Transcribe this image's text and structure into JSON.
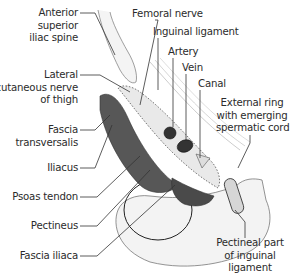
{
  "diagram": {
    "labels_left": [
      {
        "id": "asis",
        "lines": [
          "Anterior",
          "superior",
          "iliac spine"
        ]
      },
      {
        "id": "lcnt",
        "lines": [
          "Lateral",
          "cutaneous nerve",
          "of thigh"
        ]
      },
      {
        "id": "fascia_transversalis",
        "lines": [
          "Fascia",
          "transversalis"
        ]
      },
      {
        "id": "iliacus",
        "lines": [
          "Iliacus"
        ]
      },
      {
        "id": "psoas",
        "lines": [
          "Psoas tendon"
        ]
      },
      {
        "id": "pectineus",
        "lines": [
          "Pectineus"
        ]
      },
      {
        "id": "fascia_iliaca",
        "lines": [
          "Fascia iliaca"
        ]
      }
    ],
    "labels_top": [
      {
        "id": "femoral_nerve",
        "lines": [
          "Femoral nerve"
        ]
      },
      {
        "id": "inguinal_ligament",
        "lines": [
          "Inguinal ligament"
        ]
      },
      {
        "id": "artery",
        "lines": [
          "Artery"
        ]
      },
      {
        "id": "vein",
        "lines": [
          "Vein"
        ]
      },
      {
        "id": "canal",
        "lines": [
          "Canal"
        ]
      }
    ],
    "labels_right": [
      {
        "id": "external_ring",
        "lines": [
          "External ring",
          "with emerging",
          "spermatic cord"
        ]
      },
      {
        "id": "pectineal_part",
        "lines": [
          "Pectineal part",
          "of inguinal",
          "ligament"
        ]
      }
    ],
    "colors": {
      "line": "#333333",
      "muscle": "#555555",
      "vessel": "#3a3a3a",
      "bone": "#f2f2f2",
      "sheath_fill": "#e8e8e8"
    }
  }
}
